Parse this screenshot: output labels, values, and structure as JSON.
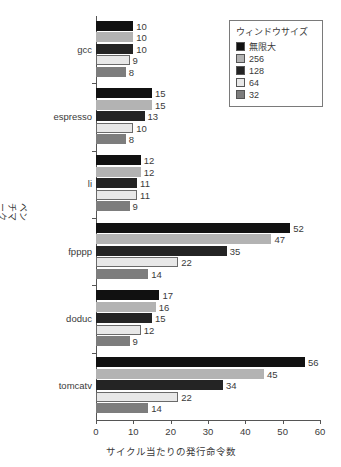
{
  "chart_data": {
    "type": "bar",
    "orientation": "horizontal",
    "title": "",
    "xlabel": "サイクル当たりの発行命令数",
    "ylabel": "ベンチマーク",
    "xlim": [
      0,
      60
    ],
    "xticks": [
      0,
      10,
      20,
      30,
      40,
      50,
      60
    ],
    "grid": false,
    "legend_position": "top-right",
    "legend_title": "ウィンドウサイズ",
    "categories": [
      "gcc",
      "espresso",
      "li",
      "fpppp",
      "doduc",
      "tomcatv"
    ],
    "series": [
      {
        "name": "無限大",
        "color": "#111111",
        "values": [
          10,
          15,
          12,
          52,
          17,
          56
        ]
      },
      {
        "name": "256",
        "color": "#b3b3b3",
        "values": [
          10,
          15,
          12,
          47,
          16,
          45
        ]
      },
      {
        "name": "128",
        "color": "#242424",
        "values": [
          10,
          13,
          11,
          35,
          15,
          34
        ]
      },
      {
        "name": "64",
        "color": "#e8e8e8",
        "values": [
          9,
          10,
          11,
          22,
          12,
          22
        ]
      },
      {
        "name": "32",
        "color": "#7d7d7d",
        "values": [
          8,
          8,
          9,
          14,
          9,
          14
        ]
      }
    ]
  },
  "legend": {
    "title": "ウィンドウサイズ",
    "items": [
      {
        "label": "無限大",
        "color": "#111111"
      },
      {
        "label": "256",
        "color": "#b3b3b3"
      },
      {
        "label": "128",
        "color": "#242424"
      },
      {
        "label": "64",
        "color": "#e8e8e8"
      },
      {
        "label": "32",
        "color": "#7d7d7d"
      }
    ]
  },
  "axes": {
    "y_title": "ベンチマーク",
    "x_title": "サイクル当たりの発行命令数",
    "x_tick_labels": [
      "0",
      "10",
      "20",
      "30",
      "40",
      "50",
      "60"
    ],
    "y_tick_labels": [
      "gcc",
      "espresso",
      "li",
      "fpppp",
      "doduc",
      "tomcatv"
    ]
  },
  "colors": {
    "axis": "#555555",
    "text": "#3a3a3a",
    "background": "#ffffff",
    "legend_border": "#7a7a7a"
  }
}
